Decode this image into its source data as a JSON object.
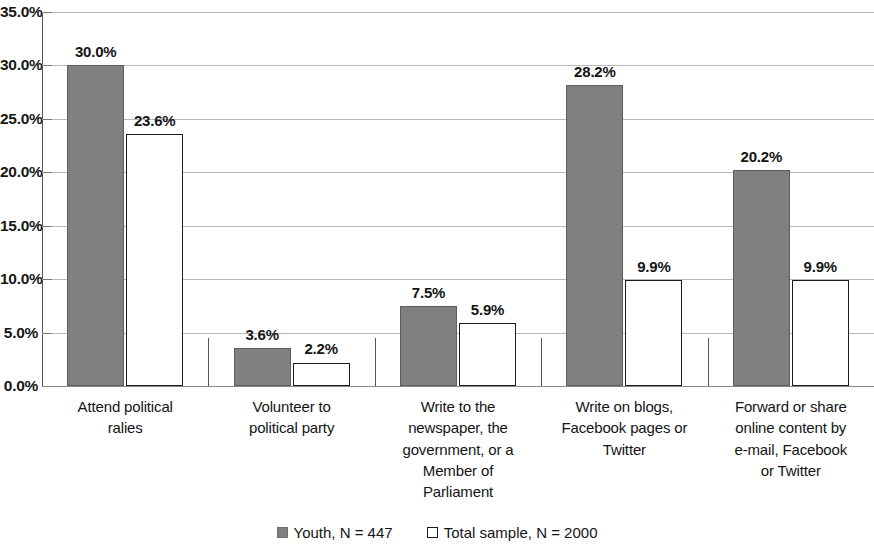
{
  "chart_data": {
    "type": "bar",
    "title": "",
    "subtitle": "",
    "xlabel": "",
    "ylabel": "",
    "ylim": [
      0,
      35
    ],
    "ytick_labels": [
      "0.0%",
      "5.0%",
      "10.0%",
      "15.0%",
      "20.0%",
      "25.0%",
      "30.0%",
      "35.0%"
    ],
    "ytick_values": [
      0,
      5,
      10,
      15,
      20,
      25,
      30,
      35
    ],
    "grid": true,
    "legend_position": "bottom",
    "value_suffix": "%",
    "categories": [
      "Attend political ralies",
      "Volunteer to political party",
      "Write to the newspaper, the government, or a Member of Parliament",
      "Write on blogs, Facebook pages or Twitter",
      "Forward or share online content by e-mail, Facebook or Twitter"
    ],
    "category_lines": [
      [
        "Attend political",
        "ralies"
      ],
      [
        "Volunteer to",
        "political party"
      ],
      [
        "Write to the",
        "newspaper, the",
        "government, or a",
        "Member of",
        "Parliament"
      ],
      [
        "Write on blogs,",
        "Facebook pages or",
        "Twitter"
      ],
      [
        "Forward or share",
        "online content by",
        "e-mail, Facebook",
        "or Twitter"
      ]
    ],
    "series": [
      {
        "name": "Youth, N = 447",
        "style": "filled",
        "color": "#808080",
        "values": [
          30.0,
          3.6,
          7.5,
          28.2,
          20.2
        ],
        "labels": [
          "30.0%",
          "3.6%",
          "7.5%",
          "28.2%",
          "20.2%"
        ]
      },
      {
        "name": "Total sample, N = 2000",
        "style": "hollow",
        "color": "#ffffff",
        "values": [
          23.6,
          2.2,
          5.9,
          9.9,
          9.9
        ],
        "labels": [
          "23.6%",
          "2.2%",
          "5.9%",
          "9.9%",
          "9.9%"
        ]
      }
    ]
  },
  "legend": {
    "items": [
      {
        "label": "Youth, N = 447",
        "swatch": "filled-square-icon"
      },
      {
        "label": "Total sample, N = 2000",
        "swatch": "hollow-square-icon"
      }
    ]
  },
  "colors": {
    "series_youth": "#808080",
    "series_total": "#ffffff",
    "gridline": "#b8b8b8",
    "axis": "#555555",
    "text": "#141414"
  }
}
